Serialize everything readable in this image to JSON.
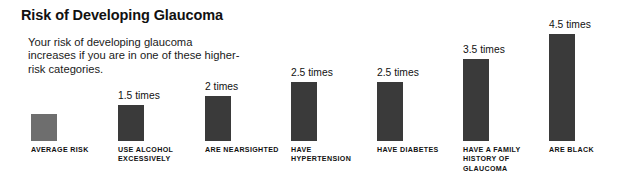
{
  "header": {
    "title": "Risk of Developing Glaucoma",
    "subtitle": "Your risk of developing glaucoma increases if you are in one of these higher-risk categories."
  },
  "style": {
    "baseline_color": "#3a3a3a",
    "highlight_color": "#6e6e6e",
    "background": "#ffffff",
    "text_color": "#111111"
  },
  "chart_data": {
    "type": "bar",
    "title": "Risk of Developing Glaucoma",
    "subtitle": "Your risk of developing glaucoma increases if you are in one of these higher-risk categories.",
    "xlabel": "",
    "ylabel": "",
    "ylim": [
      0,
      4.5
    ],
    "grid": false,
    "legend": null,
    "unit": "times",
    "categories": [
      "AVERAGE RISK",
      "USE ALCOHOL EXCESSIVELY",
      "ARE NEARSIGHTED",
      "HAVE HYPERTENSION",
      "HAVE DIABETES",
      "HAVE A FAMILY HISTORY OF GLAUCOMA",
      "ARE BLACK"
    ],
    "values": [
      1,
      1.5,
      2,
      2.5,
      2.5,
      3.5,
      4.5
    ],
    "value_labels": [
      "",
      "1.5 times",
      "2 times",
      "2.5 times",
      "2.5 times",
      "3.5 times",
      "4.5 times"
    ],
    "bar_colors": [
      "#6e6e6e",
      "#3a3a3a",
      "#3a3a3a",
      "#3a3a3a",
      "#3a3a3a",
      "#3a3a3a",
      "#3a3a3a"
    ],
    "bars": [
      {
        "category": "AVERAGE RISK",
        "value": 1,
        "label": "",
        "color": "#6e6e6e",
        "x": 31,
        "width": 26,
        "height": 27
      },
      {
        "category": "USE ALCOHOL EXCESSIVELY",
        "value": 1.5,
        "label": "1.5 times",
        "color": "#3a3a3a",
        "x": 118,
        "width": 26,
        "height": 36
      },
      {
        "category": "ARE NEARSIGHTED",
        "value": 2,
        "label": "2 times",
        "color": "#3a3a3a",
        "x": 205,
        "width": 26,
        "height": 45
      },
      {
        "category": "HAVE HYPERTENSION",
        "value": 2.5,
        "label": "2.5 times",
        "color": "#3a3a3a",
        "x": 291,
        "width": 26,
        "height": 59
      },
      {
        "category": "HAVE DIABETES",
        "value": 2.5,
        "label": "2.5 times",
        "color": "#3a3a3a",
        "x": 377,
        "width": 26,
        "height": 59
      },
      {
        "category": "HAVE A FAMILY HISTORY OF GLAUCOMA",
        "value": 3.5,
        "label": "3.5 times",
        "color": "#3a3a3a",
        "x": 463,
        "width": 26,
        "height": 82
      },
      {
        "category": "ARE BLACK",
        "value": 4.5,
        "label": "4.5 times",
        "color": "#3a3a3a",
        "x": 549,
        "width": 26,
        "height": 107
      }
    ]
  }
}
